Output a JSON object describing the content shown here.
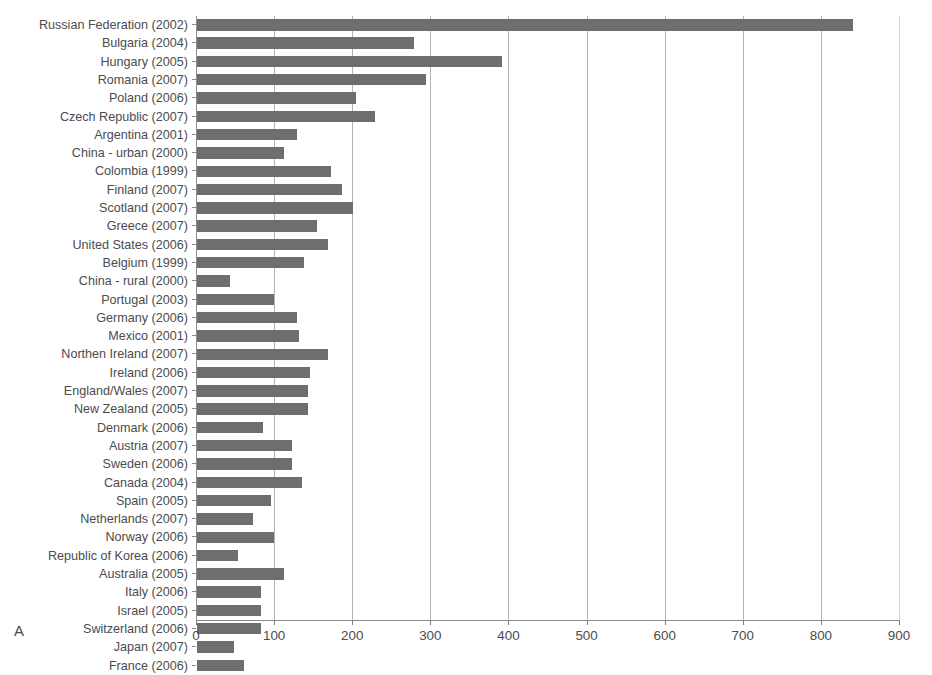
{
  "figure": {
    "panel_label": "A"
  },
  "chart_data": {
    "type": "bar",
    "orientation": "horizontal",
    "title": "",
    "xlabel": "",
    "ylabel": "",
    "xlim": [
      0,
      900
    ],
    "xticks": [
      0,
      100,
      200,
      300,
      400,
      500,
      600,
      700,
      800,
      900
    ],
    "grid": true,
    "legend": null,
    "bar_color": "#6e6e6e",
    "categories": [
      "Russian Federation (2002)",
      "Bulgaria (2004)",
      "Hungary (2005)",
      "Romania (2007)",
      "Poland (2006)",
      "Czech Republic (2007)",
      "Argentina (2001)",
      "China - urban (2000)",
      "Colombia (1999)",
      "Finland (2007)",
      "Scotland (2007)",
      "Greece (2007)",
      "United States (2006)",
      "Belgium (1999)",
      "China - rural (2000)",
      "Portugal (2003)",
      "Germany (2006)",
      "Mexico (2001)",
      "Northen Ireland (2007)",
      "Ireland (2006)",
      "England/Wales (2007)",
      "New Zealand (2005)",
      "Denmark (2006)",
      "Austria (2007)",
      "Sweden (2006)",
      "Canada (2004)",
      "Spain (2005)",
      "Netherlands (2007)",
      "Norway (2006)",
      "Republic of Korea (2006)",
      "Australia (2005)",
      "Italy (2006)",
      "Israel (2005)",
      "Switzerland (2006)",
      "Japan (2007)",
      "France (2006)"
    ],
    "values": [
      840,
      278,
      390,
      293,
      203,
      228,
      128,
      112,
      172,
      185,
      200,
      153,
      168,
      137,
      42,
      98,
      128,
      130,
      168,
      145,
      142,
      142,
      85,
      122,
      122,
      135,
      95,
      72,
      98,
      52,
      112,
      82,
      82,
      82,
      48,
      60
    ]
  }
}
